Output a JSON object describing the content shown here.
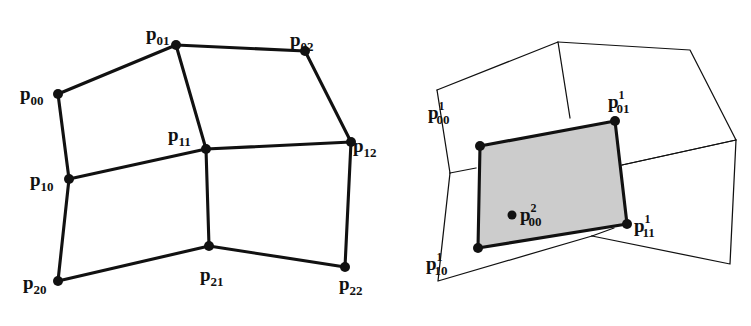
{
  "figure": {
    "caption": "",
    "background_color": "#ffffff",
    "line_color": "#111111",
    "shaded_fill_color": "#cccccc",
    "panels": [
      {
        "id": "left-panel",
        "name": "control-mesh-2x2-quads",
        "description": "Quadrilateral control mesh with nine labelled control points",
        "labels": [
          {
            "name": "label-p00",
            "base": "p",
            "sub": "00",
            "sup": "",
            "x": 20,
            "y": 100
          },
          {
            "name": "label-p01",
            "base": "p",
            "sub": "01",
            "sup": "",
            "x": 146,
            "y": 40
          },
          {
            "name": "label-p02",
            "base": "p",
            "sub": "02",
            "sup": "",
            "x": 290,
            "y": 46
          },
          {
            "name": "label-p10",
            "base": "p",
            "sub": "10",
            "sup": "",
            "x": 30,
            "y": 186
          },
          {
            "name": "label-p11",
            "base": "p",
            "sub": "11",
            "sup": "",
            "x": 168,
            "y": 141
          },
          {
            "name": "label-p12",
            "base": "p",
            "sub": "12",
            "sup": "",
            "x": 353,
            "y": 152
          },
          {
            "name": "label-p20",
            "base": "p",
            "sub": "20",
            "sup": "",
            "x": 23,
            "y": 289
          },
          {
            "name": "label-p21",
            "base": "p",
            "sub": "21",
            "sup": "",
            "x": 200,
            "y": 281
          },
          {
            "name": "label-p22",
            "base": "p",
            "sub": "22",
            "sup": "",
            "x": 339,
            "y": 290
          }
        ],
        "vertices": [
          {
            "name": "vertex-p00",
            "x": 58,
            "y": 94
          },
          {
            "name": "vertex-p01",
            "x": 176,
            "y": 45
          },
          {
            "name": "vertex-p02",
            "x": 305,
            "y": 51
          },
          {
            "name": "vertex-p10",
            "x": 69,
            "y": 179
          },
          {
            "name": "vertex-p11",
            "x": 206,
            "y": 149
          },
          {
            "name": "vertex-p12",
            "x": 351,
            "y": 142
          },
          {
            "name": "vertex-p20",
            "x": 58,
            "y": 281
          },
          {
            "name": "vertex-p21",
            "x": 209,
            "y": 246
          },
          {
            "name": "vertex-p22",
            "x": 345,
            "y": 267
          }
        ],
        "edges": [
          {
            "name": "edge-p00-p01",
            "d": "M 58 94 L 176 45"
          },
          {
            "name": "edge-p01-p02",
            "d": "M 176 45 L 305 51"
          },
          {
            "name": "edge-p00-p10",
            "d": "M 58 94 L 69 179"
          },
          {
            "name": "edge-p01-p11",
            "d": "M 176 45 L 206 149"
          },
          {
            "name": "edge-p02-p12",
            "d": "M 305 51 L 351 142"
          },
          {
            "name": "edge-p10-p11",
            "d": "M 69 179 L 206 149"
          },
          {
            "name": "edge-p11-p12",
            "d": "M 206 149 L 351 142"
          },
          {
            "name": "edge-p10-p20",
            "d": "M 69 179 L 58 281"
          },
          {
            "name": "edge-p11-p21",
            "d": "M 206 149 L 209 246"
          },
          {
            "name": "edge-p12-p22",
            "d": "M 351 142 L 345 267"
          },
          {
            "name": "edge-p20-p21",
            "d": "M 58 281 L 209 246"
          },
          {
            "name": "edge-p21-p22",
            "d": "M 209 246 L 345 267"
          }
        ]
      },
      {
        "id": "right-panel",
        "name": "refined-mesh-with-shaded-face",
        "description": "Subdivided mesh patch; shaded quadrilateral face with four level-1 corner points and a level-2 centre point",
        "labels": [
          {
            "name": "label-p00-1",
            "base": "p",
            "sub": "00",
            "sup": "1",
            "x": 428,
            "y": 119
          },
          {
            "name": "label-p01-1",
            "base": "p",
            "sub": "01",
            "sup": "1",
            "x": 608,
            "y": 108
          },
          {
            "name": "label-p10-1",
            "base": "p",
            "sub": "10",
            "sup": "1",
            "x": 426,
            "y": 270
          },
          {
            "name": "label-p11-1",
            "base": "p",
            "sub": "11",
            "sup": "1",
            "x": 634,
            "y": 232
          },
          {
            "name": "label-p00-2",
            "base": "p",
            "sub": "00",
            "sup": "2",
            "x": 520,
            "y": 221
          }
        ],
        "vertices": [
          {
            "name": "vertex-p00-1",
            "x": 480,
            "y": 146
          },
          {
            "name": "vertex-p01-1",
            "x": 615,
            "y": 121
          },
          {
            "name": "vertex-p10-1",
            "x": 478,
            "y": 248
          },
          {
            "name": "vertex-p11-1",
            "x": 627,
            "y": 224
          },
          {
            "name": "vertex-p00-2",
            "x": 512,
            "y": 215
          }
        ],
        "shaded_face": {
          "name": "shaded-quad-face",
          "d": "M 480 146 L 615 121 L 627 224 L 478 248 Z"
        },
        "thick_edges": [
          {
            "name": "edge-face-top",
            "d": "M 480 146 L 615 121"
          },
          {
            "name": "edge-face-right",
            "d": "M 615 121 L 627 224"
          },
          {
            "name": "edge-face-bottom",
            "d": "M 627 224 L 478 248"
          },
          {
            "name": "edge-face-left",
            "d": "M 478 248 L 480 146"
          }
        ],
        "thin_edges": [
          {
            "name": "edge-top-left-quad",
            "d": "M 437 90 L 558 42 L 570 118"
          },
          {
            "name": "edge-top-left-quad-lower",
            "d": "M 437 90 L 450 173"
          },
          {
            "name": "edge-top-right-quad",
            "d": "M 558 42 L 690 50 L 736 140 L 622 165"
          },
          {
            "name": "edge-right-quad",
            "d": "M 736 140 L 730 264 L 592 236"
          },
          {
            "name": "edge-right-quad-inner",
            "d": "M 622 165 L 736 140"
          },
          {
            "name": "edge-bottom-quad",
            "d": "M 592 236 L 438 281 L 450 173"
          },
          {
            "name": "edge-bottom-quad-inner",
            "d": "M 450 173 L 476 168"
          },
          {
            "name": "edge-bottom-inner-join",
            "d": "M 592 236 L 614 228"
          }
        ]
      }
    ]
  }
}
